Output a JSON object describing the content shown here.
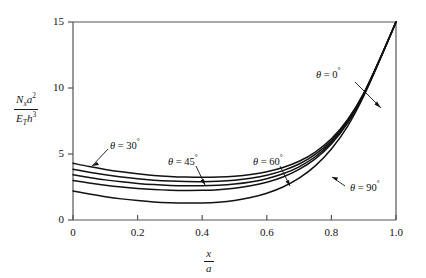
{
  "chart_data": {
    "type": "line",
    "title": "",
    "xlabel": "x/a",
    "ylabel": "Nx a^2 / (ET h^3)",
    "xlim": [
      0,
      1.0
    ],
    "ylim": [
      0,
      15
    ],
    "xticks": [
      "0",
      "0.2",
      "0.4",
      "0.6",
      "0.8",
      "1.0"
    ],
    "xtick_values": [
      0,
      0.2,
      0.4,
      0.6,
      0.8,
      1.0
    ],
    "yticks": [
      "0",
      "5",
      "10",
      "15"
    ],
    "ytick_values": [
      0,
      5,
      10,
      15
    ],
    "grid": false,
    "legend_position": "inline-annotations",
    "series": [
      {
        "name": "theta = 0°",
        "label": "θ = 0°",
        "x": [
          0.0,
          0.05,
          0.1,
          0.15,
          0.2,
          0.25,
          0.3,
          0.35,
          0.4,
          0.45,
          0.5,
          0.55,
          0.6,
          0.65,
          0.7,
          0.75,
          0.8,
          0.85,
          0.9,
          0.95,
          1.0
        ],
        "y": [
          4.3,
          4.05,
          3.83,
          3.65,
          3.5,
          3.38,
          3.3,
          3.25,
          3.23,
          3.25,
          3.32,
          3.45,
          3.66,
          3.98,
          4.45,
          5.15,
          6.15,
          7.6,
          9.6,
          12.2,
          15.0
        ]
      },
      {
        "name": "theta = 30°",
        "label": "θ = 30°",
        "x": [
          0.0,
          0.05,
          0.1,
          0.15,
          0.2,
          0.25,
          0.3,
          0.35,
          0.4,
          0.45,
          0.5,
          0.55,
          0.6,
          0.65,
          0.7,
          0.75,
          0.8,
          0.85,
          0.9,
          0.95,
          1.0
        ],
        "y": [
          3.85,
          3.62,
          3.42,
          3.25,
          3.12,
          3.02,
          2.95,
          2.91,
          2.9,
          2.93,
          3.01,
          3.16,
          3.39,
          3.74,
          4.24,
          4.97,
          6.02,
          7.52,
          9.58,
          12.2,
          15.0
        ]
      },
      {
        "name": "theta = 45°",
        "label": "θ = 45°",
        "x": [
          0.0,
          0.05,
          0.1,
          0.15,
          0.2,
          0.25,
          0.3,
          0.35,
          0.4,
          0.45,
          0.5,
          0.55,
          0.6,
          0.65,
          0.7,
          0.75,
          0.8,
          0.85,
          0.9,
          0.95,
          1.0
        ],
        "y": [
          3.42,
          3.22,
          3.04,
          2.89,
          2.77,
          2.68,
          2.62,
          2.59,
          2.59,
          2.63,
          2.72,
          2.88,
          3.13,
          3.5,
          4.03,
          4.79,
          5.88,
          7.42,
          9.52,
          12.18,
          15.0
        ]
      },
      {
        "name": "theta = 60°",
        "label": "θ = 60°",
        "x": [
          0.0,
          0.05,
          0.1,
          0.15,
          0.2,
          0.25,
          0.3,
          0.35,
          0.4,
          0.45,
          0.5,
          0.55,
          0.6,
          0.65,
          0.7,
          0.75,
          0.8,
          0.85,
          0.9,
          0.95,
          1.0
        ],
        "y": [
          3.0,
          2.81,
          2.64,
          2.5,
          2.39,
          2.31,
          2.26,
          2.24,
          2.25,
          2.3,
          2.41,
          2.59,
          2.86,
          3.26,
          3.83,
          4.63,
          5.76,
          7.34,
          9.48,
          12.16,
          15.0
        ]
      },
      {
        "name": "theta = 90°",
        "label": "θ = 90°",
        "x": [
          0.0,
          0.05,
          0.1,
          0.15,
          0.2,
          0.25,
          0.3,
          0.35,
          0.4,
          0.45,
          0.5,
          0.55,
          0.6,
          0.65,
          0.7,
          0.75,
          0.8,
          0.85,
          0.9,
          0.95,
          1.0
        ],
        "y": [
          2.2,
          1.97,
          1.77,
          1.6,
          1.47,
          1.37,
          1.31,
          1.28,
          1.29,
          1.35,
          1.48,
          1.7,
          2.03,
          2.5,
          3.17,
          4.1,
          5.38,
          7.1,
          9.38,
          12.12,
          15.0
        ]
      }
    ],
    "annotations": [
      {
        "name": "theta-0-label",
        "text": "θ = 0°",
        "symbol": "θ",
        "value": "0",
        "degree": "°",
        "leader": "arrow-down-right"
      },
      {
        "name": "theta-30-label",
        "text": "θ = 30°",
        "symbol": "θ",
        "value": "30",
        "degree": "°",
        "leader": "arrow-down-left"
      },
      {
        "name": "theta-45-label",
        "text": "θ = 45°",
        "symbol": "θ",
        "value": "45",
        "degree": "°",
        "leader": "arrow-down-right"
      },
      {
        "name": "theta-60-label",
        "text": "θ = 60°",
        "symbol": "θ",
        "value": "60",
        "degree": "°",
        "leader": "arrow-down-right"
      },
      {
        "name": "theta-90-label",
        "text": "θ = 90°",
        "symbol": "θ",
        "value": "90",
        "degree": "°",
        "leader": "arrow-up-left"
      }
    ]
  },
  "axes": {
    "y_label": {
      "numerator_var": "N",
      "numerator_sub": "x",
      "numerator_var2": "a",
      "numerator_sup": "2",
      "denominator_var": "E",
      "denominator_sub": "T",
      "denominator_var2": "h",
      "denominator_sup": "3"
    },
    "x_label": {
      "numerator": "x",
      "denominator": "a"
    },
    "y_ticks": [
      "15",
      "10",
      "5",
      "0"
    ],
    "x_ticks": [
      "0",
      "0.2",
      "0.4",
      "0.6",
      "0.8",
      "1.0"
    ]
  },
  "colors": {
    "curve": "#111111",
    "axis": "#555555",
    "text": "#1a1a1a",
    "background": "#ffffff"
  }
}
